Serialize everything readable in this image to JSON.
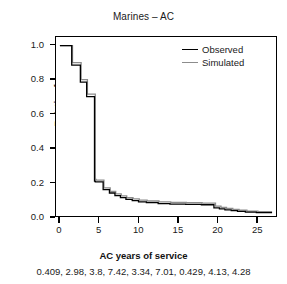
{
  "chart_data": {
    "type": "line",
    "subtype": "step-survival",
    "title": "Marines – AC",
    "xlabel": "AC years of service",
    "ylabel": "Relative frequency",
    "xlim": [
      -0.5,
      27.5
    ],
    "ylim": [
      0.0,
      1.05
    ],
    "grid": false,
    "legend_position": "top-right",
    "xticks": [
      0,
      5,
      10,
      15,
      20,
      25
    ],
    "xtick_labels": [
      "0",
      "5",
      "10",
      "15",
      "20",
      "25"
    ],
    "yticks": [
      0.0,
      0.2,
      0.4,
      0.6,
      0.8,
      1.0
    ],
    "ytick_labels": [
      "0.0",
      "0.2",
      "0.4",
      "0.6",
      "0.8",
      "1.0"
    ],
    "caption": "0.409, 2.98, 3.8, 7.42, 3.34, 7.01, 0.429, 4.13, 4.28",
    "series": [
      {
        "name": "Observed",
        "color": "#000000",
        "x": [
          0.0,
          1.5,
          1.5,
          2.6,
          2.6,
          3.4,
          3.4,
          4.4,
          4.4,
          4.5,
          4.5,
          5.5,
          5.5,
          6.3,
          6.3,
          7.0,
          7.0,
          7.7,
          7.7,
          8.4,
          8.4,
          9.2,
          9.2,
          10.0,
          10.0,
          11.0,
          11.0,
          12.5,
          12.5,
          14.0,
          14.0,
          16.0,
          16.0,
          18.0,
          18.0,
          19.6,
          19.6,
          20.3,
          20.3,
          21.0,
          21.0,
          21.8,
          21.8,
          22.6,
          22.6,
          23.6,
          23.6,
          25.0,
          25.0,
          27.0
        ],
        "y": [
          1.0,
          1.0,
          0.885,
          0.885,
          0.785,
          0.785,
          0.7,
          0.7,
          0.205,
          0.205,
          0.2,
          0.2,
          0.155,
          0.155,
          0.135,
          0.135,
          0.12,
          0.12,
          0.108,
          0.108,
          0.098,
          0.098,
          0.09,
          0.09,
          0.083,
          0.083,
          0.078,
          0.078,
          0.073,
          0.073,
          0.07,
          0.07,
          0.068,
          0.068,
          0.066,
          0.066,
          0.048,
          0.048,
          0.042,
          0.042,
          0.036,
          0.036,
          0.031,
          0.031,
          0.027,
          0.027,
          0.023,
          0.023,
          0.02,
          0.02
        ]
      },
      {
        "name": "Simulated",
        "color": "#8c8c8c",
        "x": [
          0.0,
          1.6,
          1.6,
          2.7,
          2.7,
          3.5,
          3.5,
          4.5,
          4.5,
          4.6,
          4.6,
          5.6,
          5.6,
          6.4,
          6.4,
          7.1,
          7.1,
          7.8,
          7.8,
          8.5,
          8.5,
          9.3,
          9.3,
          10.1,
          10.1,
          11.1,
          11.1,
          12.6,
          12.6,
          14.1,
          14.1,
          16.1,
          16.1,
          18.1,
          18.1,
          19.8,
          19.8,
          20.5,
          20.5,
          21.2,
          21.2,
          22.0,
          22.0,
          22.8,
          22.8,
          23.8,
          23.8,
          25.2,
          25.2,
          27.0
        ],
        "y": [
          1.0,
          1.0,
          0.9,
          0.9,
          0.8,
          0.8,
          0.715,
          0.715,
          0.215,
          0.215,
          0.21,
          0.21,
          0.165,
          0.165,
          0.145,
          0.145,
          0.13,
          0.13,
          0.118,
          0.118,
          0.108,
          0.108,
          0.1,
          0.1,
          0.093,
          0.093,
          0.088,
          0.088,
          0.083,
          0.083,
          0.08,
          0.08,
          0.078,
          0.078,
          0.076,
          0.076,
          0.058,
          0.058,
          0.051,
          0.051,
          0.045,
          0.045,
          0.039,
          0.039,
          0.034,
          0.034,
          0.029,
          0.029,
          0.025,
          0.025
        ]
      }
    ]
  },
  "legend": {
    "items": [
      {
        "label": "Observed",
        "color": "#000000"
      },
      {
        "label": "Simulated",
        "color": "#8c8c8c"
      }
    ]
  }
}
